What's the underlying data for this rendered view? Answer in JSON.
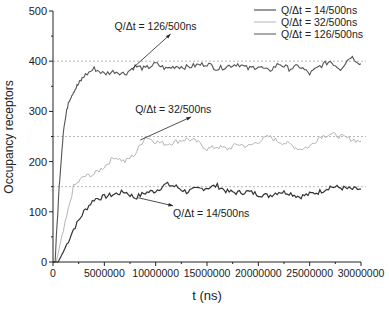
{
  "chart_data": {
    "type": "line",
    "title": "",
    "xlabel": "t (ns)",
    "ylabel": "Occupancy receptors",
    "xlim": [
      0,
      30000000
    ],
    "ylim": [
      0,
      500
    ],
    "x_ticks": [
      "0",
      "5000000",
      "10000000",
      "15000000",
      "20000000",
      "25000000",
      "30000000"
    ],
    "x_tick_values": [
      0,
      5000000,
      10000000,
      15000000,
      20000000,
      25000000,
      30000000
    ],
    "y_ticks": [
      "0",
      "100",
      "200",
      "300",
      "400",
      "500"
    ],
    "y_tick_values": [
      0,
      100,
      200,
      300,
      400,
      500
    ],
    "grid": false,
    "legend_position": "top-right",
    "reference_lines": [
      150,
      250,
      400
    ],
    "series": [
      {
        "name": "Q/Δt = 14/500ns",
        "color": "#333333",
        "rise": {
          "t0": 500000,
          "t_plateau": 4000000,
          "start": 0,
          "plateau": 130
        },
        "x": [
          0,
          500000,
          1000000,
          2000000,
          3000000,
          4000000,
          5000000,
          6000000,
          7000000,
          8000000,
          9000000,
          10000000,
          11000000,
          12000000,
          13000000,
          14000000,
          15000000,
          16000000,
          17000000,
          18000000,
          19000000,
          20000000,
          21000000,
          22000000,
          23000000,
          24000000,
          25000000,
          26000000,
          27000000,
          28000000,
          29000000,
          30000000
        ],
        "values": [
          0,
          0,
          20,
          65,
          100,
          125,
          130,
          135,
          140,
          128,
          138,
          142,
          155,
          150,
          140,
          145,
          148,
          152,
          140,
          138,
          140,
          135,
          132,
          140,
          138,
          130,
          135,
          140,
          150,
          148,
          145,
          145
        ]
      },
      {
        "name": "Q/Δt = 32/500ns",
        "color": "#b5b5b5",
        "x": [
          0,
          300000,
          1000000,
          2000000,
          3000000,
          4000000,
          5000000,
          6000000,
          7000000,
          8000000,
          9000000,
          10000000,
          11000000,
          12000000,
          13000000,
          14000000,
          15000000,
          16000000,
          17000000,
          18000000,
          19000000,
          20000000,
          21000000,
          22000000,
          23000000,
          24000000,
          25000000,
          26000000,
          27000000,
          28000000,
          29000000,
          30000000
        ],
        "values": [
          0,
          0,
          60,
          150,
          170,
          175,
          190,
          210,
          200,
          215,
          250,
          240,
          235,
          240,
          245,
          240,
          225,
          230,
          225,
          235,
          230,
          240,
          250,
          240,
          235,
          225,
          230,
          250,
          255,
          250,
          245,
          240
        ]
      },
      {
        "name": "Q/Δt = 126/500ns",
        "color": "#555555",
        "x": [
          0,
          200000,
          600000,
          1000000,
          1500000,
          2000000,
          2500000,
          3000000,
          4000000,
          5000000,
          6000000,
          7000000,
          8000000,
          9000000,
          10000000,
          11000000,
          12000000,
          13000000,
          14000000,
          15000000,
          16000000,
          17000000,
          18000000,
          19000000,
          20000000,
          21000000,
          22000000,
          23000000,
          24000000,
          25000000,
          26000000,
          27000000,
          28000000,
          29000000,
          30000000
        ],
        "values": [
          0,
          0,
          150,
          260,
          320,
          340,
          355,
          370,
          385,
          375,
          380,
          375,
          390,
          385,
          395,
          385,
          390,
          388,
          392,
          395,
          385,
          390,
          395,
          385,
          390,
          380,
          395,
          385,
          390,
          375,
          390,
          400,
          385,
          410,
          395
        ]
      }
    ],
    "annotations": [
      {
        "text": "Q/Δt = 126/500ns",
        "x": 6000000,
        "y": 462,
        "arrow_to": [
          7700000,
          385
        ]
      },
      {
        "text": "Q/Δt = 32/500ns",
        "x": 8000000,
        "y": 297,
        "arrow_to": [
          8500000,
          243
        ]
      },
      {
        "text": "Q/Δt = 14/500ns",
        "x": 11700000,
        "y": 90,
        "arrow_to": [
          8300000,
          128
        ]
      }
    ]
  }
}
